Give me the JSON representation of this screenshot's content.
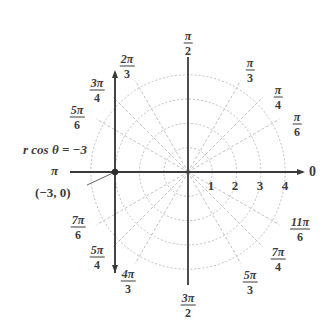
{
  "diagram": {
    "type": "polar-grid",
    "center_px": [
      188,
      172
    ],
    "unit_px": 24.3,
    "circles": [
      1,
      2,
      3,
      4
    ],
    "radial_tick_labels": [
      "1",
      "2",
      "3",
      "4"
    ],
    "polar_axis_label": "0",
    "angle_labels": [
      {
        "num": "π",
        "den": "2",
        "angle_deg": 90
      },
      {
        "num": "π",
        "den": "3",
        "angle_deg": 60
      },
      {
        "num": "π",
        "den": "4",
        "angle_deg": 45
      },
      {
        "num": "π",
        "den": "6",
        "angle_deg": 30
      },
      {
        "num": "2π",
        "den": "3",
        "angle_deg": 120
      },
      {
        "num": "3π",
        "den": "4",
        "angle_deg": 135
      },
      {
        "num": "5π",
        "den": "6",
        "angle_deg": 150
      },
      {
        "num": "7π",
        "den": "6",
        "angle_deg": 210
      },
      {
        "num": "5π",
        "den": "4",
        "angle_deg": 225
      },
      {
        "num": "4π",
        "den": "3",
        "angle_deg": 240
      },
      {
        "num": "3π",
        "den": "2",
        "angle_deg": 270
      },
      {
        "num": "5π",
        "den": "3",
        "angle_deg": 300
      },
      {
        "num": "7π",
        "den": "4",
        "angle_deg": 315
      },
      {
        "num": "11π",
        "den": "6",
        "angle_deg": 330
      }
    ],
    "pi_label": "π",
    "equation_label": "r cos θ = −3",
    "point_label": "(−3, 0)",
    "point": {
      "r": -3,
      "theta": 0
    },
    "line": {
      "equation": "r cos θ = −3",
      "cartesian_x": -3
    },
    "colors": {
      "axis": "#3a3a3a",
      "grid": "#b5b5b5",
      "line": "#4a4a4a",
      "text": "#3c3c3c"
    }
  }
}
